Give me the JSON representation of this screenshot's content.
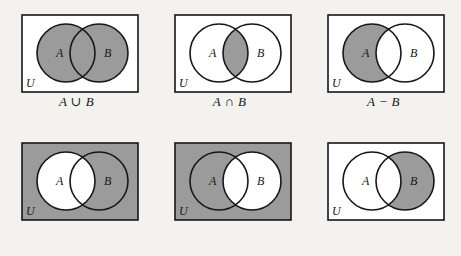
{
  "figure": {
    "background_color": "#f3f2ee",
    "shade_color": "#9b9b9b",
    "unshaded_color": "#ffffff",
    "stroke_color": "#16151a",
    "universe_label": "U",
    "set_a_label": "A",
    "set_b_label": "B",
    "rows": 2,
    "columns": 3
  },
  "panels": [
    {
      "id": "a-union-b",
      "caption": "A ∪ B",
      "operation": "union",
      "universe_label": "U",
      "labels": {
        "a": "A",
        "b": "B"
      },
      "shaded_regions": [
        "a_only",
        "intersection",
        "b_only"
      ],
      "rect_shaded": false
    },
    {
      "id": "a-intersect-b",
      "caption": "A ∩ B",
      "operation": "intersection",
      "universe_label": "U",
      "labels": {
        "a": "A",
        "b": "B"
      },
      "shaded_regions": [
        "intersection"
      ],
      "rect_shaded": false
    },
    {
      "id": "a-minus-b",
      "caption": "A − B",
      "operation": "difference",
      "universe_label": "U",
      "labels": {
        "a": "A",
        "b": "B"
      },
      "shaded_regions": [
        "a_only"
      ],
      "rect_shaded": false
    },
    {
      "id": "a-complement",
      "caption": "A′",
      "operation": "complement",
      "universe_label": "U",
      "labels": {
        "a": "A",
        "b": "B"
      },
      "shaded_regions": [
        "outside",
        "b_only"
      ],
      "rect_shaded": true
    },
    {
      "id": "b-complement",
      "caption": "B′",
      "operation": "complement",
      "universe_label": "U",
      "labels": {
        "a": "A",
        "b": "B"
      },
      "shaded_regions": [
        "outside",
        "a_only"
      ],
      "rect_shaded": true
    },
    {
      "id": "b-minus-a",
      "caption": "B − A",
      "operation": "difference",
      "universe_label": "U",
      "labels": {
        "a": "A",
        "b": "B"
      },
      "shaded_regions": [
        "b_only"
      ],
      "rect_shaded": false
    }
  ]
}
